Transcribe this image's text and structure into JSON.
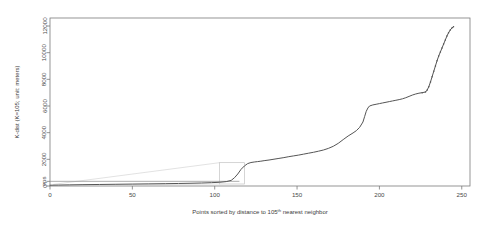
{
  "chart_data": {
    "type": "line",
    "title": "",
    "xlabel": "Points sorted by distance to 105th nearest neighbor",
    "xlabel_base": "Points sorted by distance to 105",
    "xlabel_sup": "th",
    "xlabel_tail": " nearest neighbor",
    "ylabel": "K-dist (K=105; unit: meters)",
    "xlim": [
      0,
      255
    ],
    "ylim": [
      0,
      12600
    ],
    "xticks": [
      0,
      50,
      100,
      150,
      200,
      250
    ],
    "xtick_labels": [
      "0",
      "50",
      "100",
      "150",
      "200",
      "250"
    ],
    "yticks": [
      0,
      350,
      2000,
      4000,
      6000,
      8000,
      10000,
      12000
    ],
    "ytick_labels": [
      "0",
      "eps",
      "2000",
      "4000",
      "6000",
      "8000",
      "10000",
      "12000"
    ],
    "eps_value": 350,
    "eps_label": "eps",
    "grid": false,
    "legend": "none",
    "series": [
      {
        "name": "k-distance (sorted)",
        "x": [
          0,
          5,
          12,
          20,
          30,
          40,
          50,
          60,
          70,
          78,
          85,
          92,
          98,
          103,
          107,
          110,
          112,
          114,
          116,
          118,
          120,
          122,
          124,
          126,
          128,
          130,
          133,
          136,
          139,
          142,
          145,
          148,
          151,
          154,
          157,
          160,
          163,
          166,
          169,
          172,
          175,
          178,
          181,
          184,
          186,
          188,
          190,
          191,
          192,
          193,
          194,
          196,
          198,
          200,
          202,
          204,
          206,
          208,
          210,
          212,
          214,
          216,
          218,
          220,
          222,
          224,
          226,
          228,
          229,
          230,
          231,
          232,
          233,
          234,
          235,
          236,
          237,
          238,
          239,
          240,
          241,
          242,
          243,
          244,
          245
        ],
        "y": [
          60,
          70,
          85,
          100,
          115,
          130,
          145,
          160,
          175,
          190,
          205,
          225,
          250,
          280,
          330,
          420,
          620,
          900,
          1250,
          1500,
          1680,
          1760,
          1800,
          1830,
          1860,
          1900,
          1950,
          2010,
          2070,
          2130,
          2200,
          2260,
          2320,
          2390,
          2460,
          2530,
          2610,
          2700,
          2820,
          2980,
          3200,
          3480,
          3750,
          3980,
          4150,
          4400,
          4800,
          5200,
          5600,
          5850,
          6000,
          6080,
          6130,
          6180,
          6230,
          6280,
          6330,
          6380,
          6430,
          6480,
          6540,
          6620,
          6720,
          6820,
          6900,
          6960,
          7000,
          7050,
          7200,
          7450,
          7800,
          8200,
          8600,
          9000,
          9400,
          9750,
          10050,
          10350,
          10650,
          10950,
          11250,
          11500,
          11700,
          11850,
          11950
        ]
      }
    ],
    "annotations": [
      {
        "name": "inset-wedge",
        "description": "faint triangular guide lines from left baseline to inset box"
      },
      {
        "name": "inset-box",
        "description": "faint rectangle outline near x=105-118 at baseline"
      }
    ],
    "colors": {
      "background": "#ffffff",
      "frame": "#7a7a7a",
      "curve": "#555555",
      "guide": "#c8c8c8",
      "text": "#4a4a4a"
    }
  }
}
